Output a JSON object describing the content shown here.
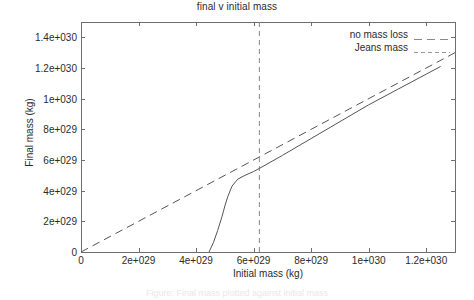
{
  "chart_data": {
    "type": "line",
    "title": "final v initial mass",
    "xlabel": "Initial mass (kg)",
    "ylabel": "Final mass (kg)",
    "xlim": [
      0,
      1.3e+30
    ],
    "ylim": [
      0,
      1.5e+30
    ],
    "xticks": [
      {
        "value": 0,
        "label": "0"
      },
      {
        "value": 2e+29,
        "label": "2e+029"
      },
      {
        "value": 4e+29,
        "label": "4e+029"
      },
      {
        "value": 6e+29,
        "label": "6e+029"
      },
      {
        "value": 8e+29,
        "label": "8e+029"
      },
      {
        "value": 1e+30,
        "label": "1e+030"
      },
      {
        "value": 1.2e+30,
        "label": "1.2e+030"
      }
    ],
    "yticks": [
      {
        "value": 0,
        "label": "0"
      },
      {
        "value": 2e+29,
        "label": "2e+029"
      },
      {
        "value": 4e+29,
        "label": "4e+029"
      },
      {
        "value": 6e+29,
        "label": "6e+029"
      },
      {
        "value": 8e+29,
        "label": "8e+029"
      },
      {
        "value": 1e+30,
        "label": "1e+030"
      },
      {
        "value": 1.2e+30,
        "label": "1.2e+030"
      },
      {
        "value": 1.4e+30,
        "label": "1.4e+030"
      }
    ],
    "grid": false,
    "legend_position": "top-right",
    "series": [
      {
        "name": "no mass loss",
        "style": "dashed-long",
        "color": "#555555",
        "points": [
          [
            0,
            0
          ],
          [
            1.3e+30,
            1.3e+30
          ]
        ]
      },
      {
        "name": "Jeans mass",
        "style": "dashed-short-vertical",
        "color": "#888888",
        "x_value": 6.2e+29,
        "points": [
          [
            6.2e+29,
            0
          ],
          [
            6.2e+29,
            1.5e+30
          ]
        ]
      },
      {
        "name": "final mass curve",
        "style": "solid",
        "color": "#555555",
        "points": [
          [
            4.45e+29,
            0
          ],
          [
            4.6e+29,
            6e+28
          ],
          [
            4.75e+29,
            1.4e+29
          ],
          [
            4.9e+29,
            2.3e+29
          ],
          [
            5e+29,
            3e+29
          ],
          [
            5.1e+29,
            3.6e+29
          ],
          [
            5.25e+29,
            4.3e+29
          ],
          [
            5.45e+29,
            4.75e+29
          ],
          [
            5.7e+29,
            5e+29
          ],
          [
            6e+29,
            5.25e+29
          ],
          [
            6.2e+29,
            5.45e+29
          ],
          [
            7e+29,
            6.3e+29
          ],
          [
            8e+29,
            7.4e+29
          ],
          [
            9e+29,
            8.5e+29
          ],
          [
            1e+30,
            9.6e+29
          ],
          [
            1.1e+30,
            1.06e+30
          ],
          [
            1.2e+30,
            1.16e+30
          ],
          [
            1.25e+30,
            1.21e+30
          ]
        ]
      }
    ]
  },
  "legend": {
    "entries": [
      {
        "label": "no mass loss"
      },
      {
        "label": "Jeans mass"
      }
    ]
  },
  "caption": "Figure: Final mass plotted against initial mass"
}
